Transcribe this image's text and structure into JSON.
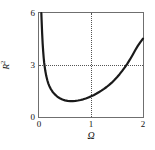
{
  "figure": {
    "background_color": "#ffffff",
    "frame_color": "#6f6f6f",
    "curve_color": "#1a1a1a",
    "grid_color": "#555555",
    "text_color": "#111111"
  },
  "chart_data": {
    "type": "line",
    "title": "",
    "subtitle": "",
    "xlabel": "Ω",
    "ylabel": "R²",
    "ylabel_base": "R",
    "ylabel_exponent": "2",
    "xlim": [
      0,
      2
    ],
    "ylim": [
      0,
      6
    ],
    "xticks": [
      0,
      1,
      2
    ],
    "xticklabels": [
      "0",
      "1",
      "2"
    ],
    "yticks": [
      0,
      3,
      6
    ],
    "yticklabels": [
      "0",
      "3",
      "6"
    ],
    "grid": true,
    "gridlines": {
      "horizontal": [
        3
      ],
      "vertical": [
        1
      ]
    },
    "legend": null,
    "legend_position": "none",
    "annotations": [],
    "series": [
      {
        "name": "R² vs Ω",
        "x": [
          0.045,
          0.05,
          0.06,
          0.07,
          0.08,
          0.09,
          0.1,
          0.12,
          0.14,
          0.16,
          0.18,
          0.2,
          0.23,
          0.26,
          0.3,
          0.35,
          0.4,
          0.45,
          0.5,
          0.55,
          0.6,
          0.65,
          0.7,
          0.75,
          0.8,
          0.85,
          0.9,
          0.95,
          1.0,
          1.05,
          1.1,
          1.15,
          1.2,
          1.25,
          1.3,
          1.35,
          1.4,
          1.45,
          1.5,
          1.55,
          1.6,
          1.65,
          1.7,
          1.75,
          1.8,
          1.85,
          1.9,
          1.95,
          2.0
        ],
        "y": [
          6.0,
          5.6,
          4.85,
          4.25,
          3.8,
          3.42,
          3.12,
          2.68,
          2.36,
          2.12,
          1.93,
          1.78,
          1.6,
          1.46,
          1.32,
          1.18,
          1.08,
          1.01,
          0.96,
          0.93,
          0.92,
          0.92,
          0.93,
          0.95,
          0.98,
          1.02,
          1.07,
          1.13,
          1.19,
          1.26,
          1.34,
          1.43,
          1.52,
          1.62,
          1.73,
          1.85,
          1.98,
          2.13,
          2.29,
          2.47,
          2.66,
          2.86,
          3.08,
          3.32,
          3.58,
          3.85,
          4.1,
          4.32,
          4.52
        ]
      }
    ],
    "notes": {
      "minimum": {
        "x": 0.6,
        "y": 0.92
      },
      "crosses_y3_at_x": 1.87,
      "endpoint": {
        "x": 2.0,
        "y": 4.52
      }
    }
  }
}
